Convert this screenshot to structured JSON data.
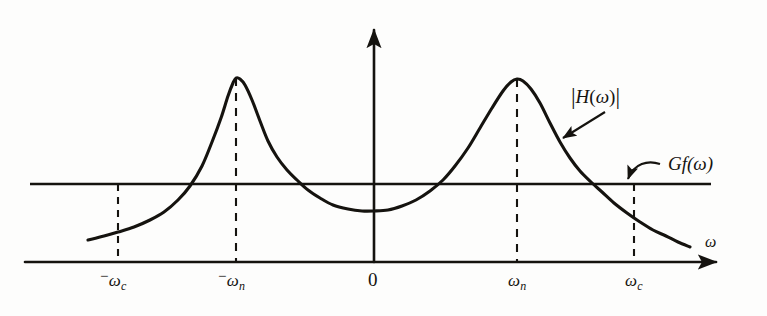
{
  "figure": {
    "kind": "hand-drawn-plot",
    "background_color": "#fdfdfc",
    "ink_color": "#15130f",
    "axis_variable_label": "ω",
    "origin_label": "0"
  },
  "labels": {
    "transfer_function": {
      "text": "|H(ω)|",
      "bar": "|",
      "body": "H",
      "open_paren": "(",
      "arg": "ω",
      "close_paren": ")"
    },
    "noise_spectrum": {
      "text": "Gf(ω)",
      "body": "Gf",
      "open_paren": "(",
      "arg": "ω",
      "close_paren": ")"
    }
  },
  "axis_ticks": [
    {
      "id": "neg-omega-c",
      "sign": "−",
      "symbol": "ω",
      "subscript": "c",
      "x": 118
    },
    {
      "id": "neg-omega-n",
      "sign": "−",
      "symbol": "ω",
      "subscript": "n",
      "x": 236
    },
    {
      "id": "origin",
      "sign": "",
      "symbol": "0",
      "subscript": "",
      "x": 374
    },
    {
      "id": "omega-n",
      "sign": "",
      "symbol": "ω",
      "subscript": "n",
      "x": 517
    },
    {
      "id": "omega-c",
      "sign": "",
      "symbol": "ω",
      "subscript": "c",
      "x": 634
    }
  ],
  "chart_data": {
    "type": "line",
    "title": "",
    "subtitle": "",
    "xlabel": "ω",
    "ylabel": "",
    "grid": false,
    "legend_position": "inline-annotations",
    "xlim": [
      -1.35,
      1.35
    ],
    "ylim": [
      0,
      1.0
    ],
    "axis": {
      "x_axis_y_px": 262,
      "x_axis_x_start_px": 25,
      "x_axis_x_end_px": 722,
      "y_axis_x_px": 374,
      "y_axis_y_top_px": 23,
      "y_axis_y_bottom_px": 262
    },
    "annotations": [
      {
        "id": "h-omega-label",
        "text": "|H(ω)|",
        "label_x": 571,
        "label_y": 93,
        "arrow_from_x": 605,
        "arrow_from_y": 112,
        "arrow_to_x": 561,
        "arrow_to_y": 140,
        "arrow_style": "straight"
      },
      {
        "id": "gf-omega-label",
        "text": "Gf(ω)",
        "label_x": 660,
        "label_y": 163,
        "arrow_from_x": 658,
        "arrow_from_y": 166,
        "arrow_to_x": 627,
        "arrow_to_y": 183,
        "arrow_style": "curved"
      }
    ],
    "series": [
      {
        "name": "|H(ω)|",
        "style": "solid",
        "description": "Double-humped resonance magnitude response, symmetric about ω = 0, peaks at ±ωn, shallow minimum at ω = 0, decaying tails beyond ±ωc",
        "points_px": [
          [
            88,
            240
          ],
          [
            104,
            236
          ],
          [
            118,
            232
          ],
          [
            134,
            227
          ],
          [
            150,
            220
          ],
          [
            164,
            212
          ],
          [
            178,
            200
          ],
          [
            190,
            186
          ],
          [
            202,
            166
          ],
          [
            212,
            142
          ],
          [
            221,
            118
          ],
          [
            228,
            96
          ],
          [
            233,
            83
          ],
          [
            236,
            78
          ],
          [
            240,
            79
          ],
          [
            245,
            85
          ],
          [
            252,
            100
          ],
          [
            260,
            121
          ],
          [
            268,
            141
          ],
          [
            277,
            157
          ],
          [
            287,
            170
          ],
          [
            297,
            180
          ],
          [
            308,
            190
          ],
          [
            320,
            198
          ],
          [
            333,
            205
          ],
          [
            348,
            209
          ],
          [
            362,
            211
          ],
          [
            374,
            211
          ],
          [
            388,
            210
          ],
          [
            402,
            206
          ],
          [
            416,
            200
          ],
          [
            430,
            191
          ],
          [
            443,
            180
          ],
          [
            455,
            166
          ],
          [
            468,
            148
          ],
          [
            480,
            128
          ],
          [
            492,
            108
          ],
          [
            503,
            91
          ],
          [
            511,
            82
          ],
          [
            517,
            79
          ],
          [
            523,
            81
          ],
          [
            531,
            89
          ],
          [
            540,
            103
          ],
          [
            550,
            123
          ],
          [
            560,
            142
          ],
          [
            570,
            158
          ],
          [
            580,
            171
          ],
          [
            591,
            182
          ],
          [
            602,
            192
          ],
          [
            614,
            203
          ],
          [
            627,
            213
          ],
          [
            640,
            222
          ],
          [
            653,
            230
          ],
          [
            666,
            236
          ],
          [
            678,
            242
          ],
          [
            690,
            247
          ]
        ],
        "peaks": [
          {
            "at": "-ωn",
            "x_px": 236,
            "y_px": 78
          },
          {
            "at": "ωn",
            "x_px": 517,
            "y_px": 79
          }
        ],
        "minimum": {
          "at": "0",
          "x_px": 374,
          "y_px": 211
        }
      },
      {
        "name": "Gf(ω)",
        "style": "solid-horizontal",
        "description": "Flat noise power spectral density level, constant across all ω",
        "y_px": 184,
        "x_start_px": 30,
        "x_end_px": 711
      }
    ],
    "dashed_guides": [
      {
        "id": "guide-neg-omega-c",
        "x_px": 118,
        "y_top_px": 184,
        "y_bottom_px": 262
      },
      {
        "id": "guide-neg-omega-n",
        "x_px": 236,
        "y_top_px": 78,
        "y_bottom_px": 262
      },
      {
        "id": "guide-omega-n",
        "x_px": 517,
        "y_top_px": 79,
        "y_bottom_px": 262
      },
      {
        "id": "guide-omega-c",
        "x_px": 634,
        "y_top_px": 184,
        "y_bottom_px": 262
      }
    ]
  }
}
